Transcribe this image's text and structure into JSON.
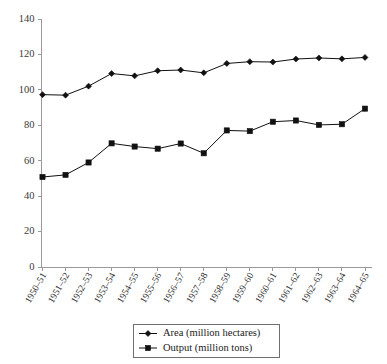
{
  "chart_data": {
    "type": "line",
    "title": "",
    "subtitle": "",
    "xlabel": "",
    "ylabel": "",
    "ylim": [
      0,
      140
    ],
    "ytick_step": 20,
    "yticks": [
      0,
      20,
      40,
      60,
      80,
      100,
      120,
      140
    ],
    "grid": false,
    "legend_position": "bottom-center",
    "categories": [
      "1950–51",
      "1951–52",
      "1952–53",
      "1953–54",
      "1954–55",
      "1955–56",
      "1956–57",
      "1957–58",
      "1958–59",
      "1959–60",
      "1960–61",
      "1961–62",
      "1962–63",
      "1963–64",
      "1964–65"
    ],
    "series": [
      {
        "name": "Area (million hectares)",
        "marker": "diamond",
        "color": "#111111",
        "values": [
          97.3,
          97.0,
          102.1,
          109.2,
          107.9,
          110.8,
          111.2,
          109.6,
          114.9,
          115.9,
          115.7,
          117.4,
          118.0,
          117.5,
          118.3
        ]
      },
      {
        "name": "Output (million tons)",
        "marker": "square",
        "color": "#111111",
        "values": [
          50.8,
          52.0,
          59.0,
          69.8,
          68.0,
          66.8,
          69.7,
          64.2,
          77.1,
          76.7,
          82.0,
          82.7,
          80.2,
          80.6,
          89.4
        ]
      }
    ]
  },
  "legend": {
    "items": [
      {
        "label": "Area (million hectares)",
        "marker": "diamond"
      },
      {
        "label": "Output (million tons)",
        "marker": "square"
      }
    ]
  }
}
